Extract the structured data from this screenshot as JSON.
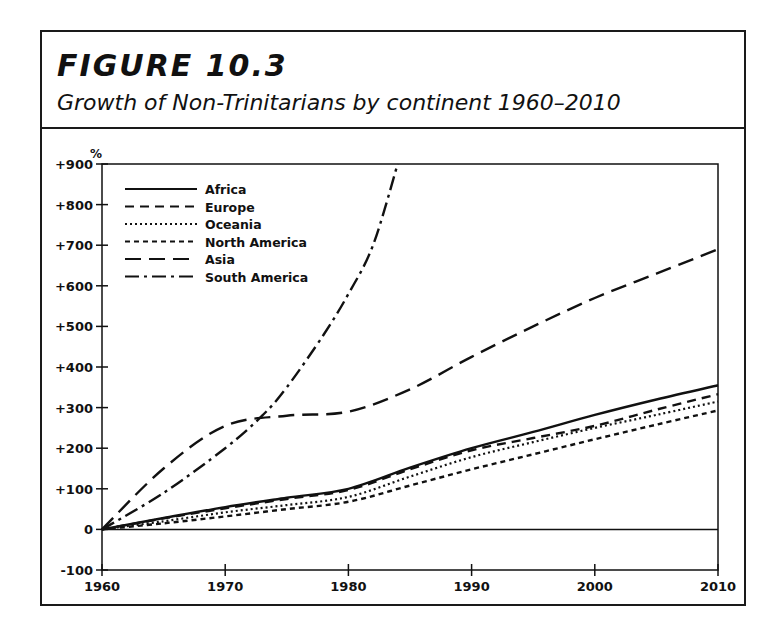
{
  "figure": {
    "label": "FIGURE 10.3",
    "subtitle": "Growth of Non-Trinitarians by continent 1960–2010"
  },
  "chart_data": {
    "type": "line",
    "title": "FIGURE 10.3",
    "subtitle": "Growth of Non-Trinitarians by continent 1960–2010",
    "xlabel": "",
    "ylabel": "%",
    "x_ticks": [
      "1960",
      "1970",
      "1980",
      "1990",
      "2000",
      "2010"
    ],
    "y_ticks": [
      "+900",
      "+800",
      "+700",
      "+600",
      "+500",
      "+400",
      "+300",
      "+200",
      "+100",
      "0",
      "-100"
    ],
    "xlim": [
      1960,
      2010
    ],
    "ylim": [
      -100,
      900
    ],
    "grid": false,
    "legend_position": "upper-left",
    "x": [
      1960,
      1965,
      1970,
      1975,
      1980,
      1985,
      1990,
      1995,
      2000,
      2005,
      2010
    ],
    "series": [
      {
        "name": "Africa",
        "style": "solid",
        "values": [
          0,
          28,
          55,
          78,
          100,
          152,
          200,
          240,
          282,
          320,
          355
        ]
      },
      {
        "name": "Europe",
        "style": "dashed",
        "values": [
          0,
          27,
          52,
          75,
          97,
          148,
          195,
          225,
          255,
          295,
          333
        ]
      },
      {
        "name": "Oceania",
        "style": "dotted",
        "values": [
          0,
          20,
          42,
          60,
          80,
          130,
          178,
          215,
          250,
          282,
          315
        ]
      },
      {
        "name": "North America",
        "style": "short-dashed",
        "values": [
          0,
          15,
          32,
          50,
          68,
          108,
          148,
          185,
          222,
          258,
          293
        ]
      },
      {
        "name": "Asia",
        "style": "long-dashed",
        "values": [
          0,
          150,
          255,
          280,
          290,
          345,
          425,
          500,
          570,
          630,
          690
        ]
      },
      {
        "name": "South America",
        "style": "dash-dot",
        "x": [
          1960,
          1965,
          1970,
          1973,
          1975,
          1978,
          1980,
          1982,
          1984
        ],
        "values": [
          0,
          90,
          200,
          280,
          350,
          480,
          580,
          700,
          900
        ]
      }
    ]
  },
  "legend": [
    {
      "label": "Africa"
    },
    {
      "label": "Europe"
    },
    {
      "label": "Oceania"
    },
    {
      "label": "North America"
    },
    {
      "label": "Asia"
    },
    {
      "label": "South America"
    }
  ],
  "axis": {
    "y_unit": "%"
  },
  "colors": {
    "ink": "#111111",
    "background": "#ffffff"
  }
}
